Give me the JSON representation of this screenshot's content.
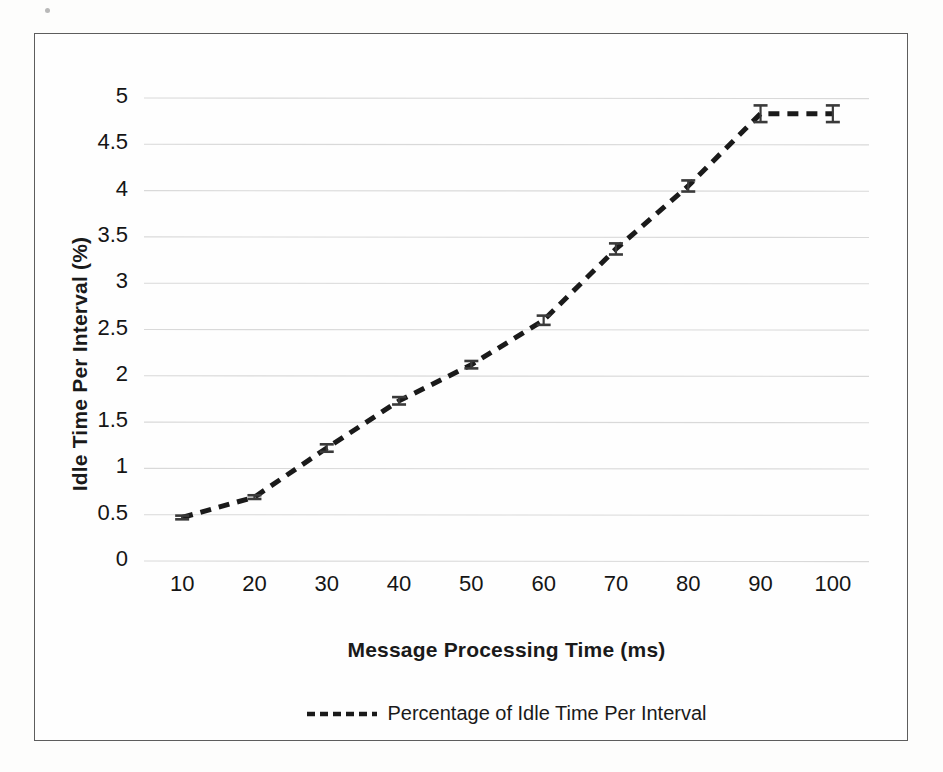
{
  "chart_data": {
    "type": "line",
    "title": "",
    "subtitle": "",
    "xlabel": "Message Processing Time (ms)",
    "ylabel": "Idle Time Per Interval  (%)",
    "x": [
      10,
      20,
      30,
      40,
      50,
      60,
      70,
      80,
      90,
      100
    ],
    "xlim": [
      5,
      105
    ],
    "ylim": [
      0,
      5
    ],
    "xticks": [
      "10",
      "20",
      "30",
      "40",
      "50",
      "60",
      "70",
      "80",
      "90",
      "100"
    ],
    "yticks": [
      "0",
      "0.5",
      "1",
      "1.5",
      "2",
      "2.5",
      "3",
      "3.5",
      "4",
      "4.5",
      "5"
    ],
    "grid": "horizontal",
    "legend_position": "bottom-center",
    "line_style": "dashed",
    "line_color": "#1a1a1a",
    "gridline_color": "#d9d9d9",
    "border_color": "#5d5d5d",
    "series": [
      {
        "name": "Percentage of Idle Time Per Interval",
        "values": [
          0.47,
          0.69,
          1.22,
          1.73,
          2.12,
          2.6,
          3.37,
          4.05,
          4.83,
          4.83
        ],
        "errors": [
          0.02,
          0.02,
          0.04,
          0.04,
          0.04,
          0.05,
          0.06,
          0.06,
          0.09,
          0.09
        ]
      }
    ]
  },
  "legend": {
    "entries": [
      {
        "label": "Percentage of Idle Time Per Interval",
        "marker": "dashed-line"
      }
    ]
  },
  "axes": {
    "x_title": "Message Processing Time (ms)",
    "y_title": "Idle Time Per Interval  (%)"
  }
}
